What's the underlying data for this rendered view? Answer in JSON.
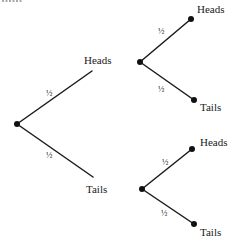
{
  "diagram": {
    "type": "probability-tree",
    "title_cutoff": "",
    "colors": {
      "ink": "#1a1a1a",
      "background": "#ffffff"
    },
    "root": {
      "x": 17,
      "y": 124
    },
    "branches": [
      {
        "id": "first-heads",
        "label": "Heads",
        "probability": "½",
        "from": {
          "x": 17,
          "y": 124
        },
        "to": {
          "x": 92,
          "y": 71
        },
        "label_pos": {
          "x": 84,
          "y": 64
        },
        "prob_pos": {
          "x": 46,
          "y": 96
        }
      },
      {
        "id": "first-tails",
        "label": "Tails",
        "probability": "½",
        "from": {
          "x": 17,
          "y": 124
        },
        "to": {
          "x": 93,
          "y": 177
        },
        "label_pos": {
          "x": 86,
          "y": 193
        },
        "prob_pos": {
          "x": 46,
          "y": 158
        }
      }
    ],
    "subtrees": [
      {
        "id": "subtree-upper",
        "node": {
          "x": 140,
          "y": 62
        },
        "branches": [
          {
            "label": "Heads",
            "probability": "½",
            "to": {
              "x": 191,
              "y": 19
            },
            "label_pos": {
              "x": 197,
              "y": 13
            },
            "prob_pos": {
              "x": 158,
              "y": 34
            }
          },
          {
            "label": "Tails",
            "probability": "½",
            "to": {
              "x": 194,
              "y": 100
            },
            "label_pos": {
              "x": 200,
              "y": 111
            },
            "prob_pos": {
              "x": 158,
              "y": 92
            }
          }
        ]
      },
      {
        "id": "subtree-lower",
        "node": {
          "x": 142,
          "y": 189
        },
        "branches": [
          {
            "label": "Heads",
            "probability": "½",
            "to": {
              "x": 192,
              "y": 149
            },
            "label_pos": {
              "x": 200,
              "y": 146
            },
            "prob_pos": {
              "x": 162,
              "y": 165
            }
          },
          {
            "label": "Tails",
            "probability": "½",
            "to": {
              "x": 194,
              "y": 224
            },
            "label_pos": {
              "x": 200,
              "y": 236
            },
            "prob_pos": {
              "x": 161,
              "y": 216
            }
          }
        ]
      }
    ]
  }
}
